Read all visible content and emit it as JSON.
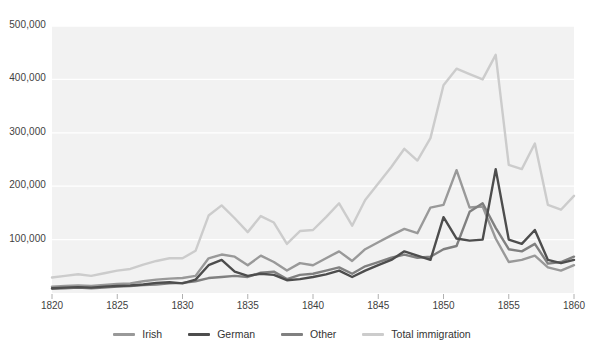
{
  "chart_data": {
    "type": "line",
    "title": "",
    "subtitle": "",
    "xlabel": "",
    "ylabel": "",
    "xlim": [
      1820,
      1860
    ],
    "ylim": [
      0,
      500000
    ],
    "grid": true,
    "legend_position": "bottom",
    "x_ticks": [
      "1820",
      "1825",
      "1830",
      "1835",
      "1840",
      "1845",
      "1850",
      "1855",
      "1860"
    ],
    "x_tick_values": [
      1820,
      1825,
      1830,
      1835,
      1840,
      1845,
      1850,
      1855,
      1860
    ],
    "y_ticks": [
      "100,000",
      "200,000",
      "300,000",
      "400,000",
      "500,000"
    ],
    "y_tick_values": [
      100000,
      200000,
      300000,
      400000,
      500000
    ],
    "x": [
      1820,
      1821,
      1822,
      1823,
      1824,
      1825,
      1826,
      1827,
      1828,
      1829,
      1830,
      1831,
      1832,
      1833,
      1834,
      1835,
      1836,
      1837,
      1838,
      1839,
      1840,
      1841,
      1842,
      1843,
      1844,
      1845,
      1846,
      1847,
      1848,
      1849,
      1850,
      1851,
      1852,
      1853,
      1854,
      1855,
      1856,
      1857,
      1858,
      1859,
      1860
    ],
    "series": [
      {
        "name": "Irish",
        "color": "#999999",
        "values": [
          12000,
          13000,
          14000,
          13000,
          15000,
          17000,
          18000,
          22000,
          25000,
          27000,
          28000,
          32000,
          65000,
          72000,
          68000,
          52000,
          70000,
          58000,
          42000,
          56000,
          52000,
          65000,
          78000,
          60000,
          82000,
          95000,
          108000,
          120000,
          112000,
          160000,
          165000,
          230000,
          160000,
          162000,
          102000,
          58000,
          62000,
          70000,
          48000,
          42000,
          52000
        ]
      },
      {
        "name": "German",
        "color": "#4d4d4d",
        "values": [
          9000,
          10000,
          11000,
          10000,
          12000,
          13000,
          14000,
          16000,
          19000,
          20000,
          18000,
          25000,
          52000,
          62000,
          40000,
          32000,
          36000,
          34000,
          24000,
          26000,
          30000,
          35000,
          42000,
          30000,
          42000,
          52000,
          62000,
          78000,
          70000,
          62000,
          142000,
          102000,
          98000,
          100000,
          232000,
          100000,
          92000,
          118000,
          62000,
          56000,
          62000
        ]
      },
      {
        "name": "Other",
        "color": "#808080",
        "values": [
          8000,
          9000,
          10000,
          9000,
          10000,
          12000,
          13000,
          15000,
          16000,
          18000,
          19000,
          22000,
          28000,
          30000,
          32000,
          30000,
          38000,
          40000,
          26000,
          34000,
          36000,
          42000,
          48000,
          36000,
          50000,
          58000,
          66000,
          72000,
          66000,
          68000,
          82000,
          88000,
          152000,
          168000,
          122000,
          82000,
          78000,
          92000,
          55000,
          58000,
          68000
        ]
      },
      {
        "name": "Total immigration",
        "color": "#cccccc",
        "values": [
          29000,
          32000,
          35000,
          32000,
          37000,
          42000,
          45000,
          53000,
          60000,
          65000,
          65000,
          79000,
          145000,
          164000,
          140000,
          114000,
          144000,
          132000,
          92000,
          116000,
          118000,
          142000,
          168000,
          126000,
          174000,
          205000,
          236000,
          270000,
          248000,
          290000,
          389000,
          420000,
          410000,
          400000,
          446000,
          240000,
          232000,
          280000,
          165000,
          156000,
          182000
        ]
      }
    ]
  },
  "legend": {
    "items": [
      {
        "label": "Irish",
        "color": "#999999"
      },
      {
        "label": "German",
        "color": "#4d4d4d"
      },
      {
        "label": "Other",
        "color": "#808080"
      },
      {
        "label": "Total immigration",
        "color": "#cccccc"
      }
    ]
  },
  "style": {
    "plot_background": "#f2f2f2",
    "gridline_color": "#ffffff",
    "axis_text_color": "#3f3f3f",
    "page_background": "#ffffff"
  }
}
